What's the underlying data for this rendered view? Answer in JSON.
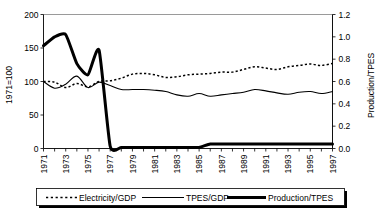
{
  "chart_data": {
    "type": "line",
    "title": "",
    "xlabel": "",
    "ylabel": "1971=100",
    "y2label": "Production/TPES",
    "grid": false,
    "legend_position": "bottom",
    "ylim": [
      0,
      200
    ],
    "y2lim": [
      0.0,
      1.2
    ],
    "xlim": [
      1971,
      1997
    ],
    "yticks": [
      "0",
      "50",
      "100",
      "150",
      "200"
    ],
    "ytick_values": [
      0,
      50,
      100,
      150,
      200
    ],
    "y2ticks": [
      "0.0",
      "0.2",
      "0.4",
      "0.6",
      "0.8",
      "1.0",
      "1.2"
    ],
    "y2tick_values": [
      0.0,
      0.2,
      0.4,
      0.6,
      0.8,
      1.0,
      1.2
    ],
    "xticks": [
      "1971",
      "1973",
      "1975",
      "1977",
      "1979",
      "1981",
      "1983",
      "1985",
      "1987",
      "1989",
      "1991",
      "1993",
      "1995",
      "1997"
    ],
    "x": [
      1971,
      1972,
      1973,
      1974,
      1975,
      1976,
      1977,
      1978,
      1979,
      1980,
      1981,
      1982,
      1983,
      1984,
      1985,
      1986,
      1987,
      1988,
      1989,
      1990,
      1991,
      1992,
      1993,
      1994,
      1995,
      1996,
      1997
    ],
    "series": [
      {
        "name": "Electricity/GDP",
        "axis": "left",
        "style": "dotted",
        "values": [
          100,
          99,
          91,
          97,
          92,
          100,
          101,
          105,
          111,
          112,
          110,
          106,
          107,
          110,
          111,
          112,
          114,
          114,
          118,
          122,
          120,
          118,
          122,
          124,
          126,
          124,
          127
        ]
      },
      {
        "name": "TPES/GDP",
        "axis": "left",
        "style": "thin-solid",
        "values": [
          100,
          90,
          96,
          108,
          91,
          99,
          94,
          88,
          88,
          88,
          87,
          85,
          80,
          78,
          82,
          78,
          80,
          82,
          84,
          88,
          86,
          83,
          81,
          84,
          85,
          82,
          85
        ]
      },
      {
        "name": "Production/TPES",
        "axis": "right",
        "style": "thick-solid",
        "values": [
          0.92,
          1.0,
          1.02,
          0.76,
          0.66,
          0.88,
          0.02,
          0.01,
          0.01,
          0.01,
          0.01,
          0.01,
          0.01,
          0.01,
          0.01,
          0.04,
          0.04,
          0.04,
          0.04,
          0.04,
          0.04,
          0.04,
          0.04,
          0.04,
          0.04,
          0.04,
          0.04
        ]
      }
    ],
    "legend": [
      {
        "label": "Electricity/GDP",
        "style": "dotted"
      },
      {
        "label": "TPES/GDP",
        "style": "thin-solid"
      },
      {
        "label": "Production/TPES",
        "style": "thick-solid"
      }
    ]
  }
}
